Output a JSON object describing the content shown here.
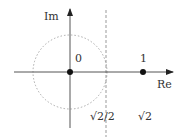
{
  "diagram": {
    "axes": {
      "x_label": "Re",
      "y_label": "Im"
    },
    "points": [
      {
        "label": "0",
        "value": 0
      },
      {
        "label": "1",
        "value": 1
      }
    ],
    "circle": {
      "center": 0,
      "radius": "√2/2",
      "style": "dotted"
    },
    "vertical_line": {
      "x": "√2/2",
      "style": "dashed"
    },
    "tick_labels": {
      "sqrt2_over_2": "√2/2",
      "sqrt2": "√2"
    },
    "colors": {
      "axis": "#555555",
      "point": "#111111",
      "circle": "#aaaaaa",
      "dashed_line": "#999999",
      "text": "#333333"
    }
  }
}
